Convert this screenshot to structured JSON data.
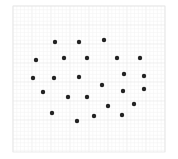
{
  "chart_data": {
    "type": "scatter",
    "title": "",
    "xlabel": "",
    "ylabel": "",
    "grid": true,
    "legend": null,
    "axis_ticks_visible": false,
    "frame": {
      "x0": 13,
      "y0": 6,
      "x1": 165,
      "y1": 152
    },
    "grid_style": {
      "major_step": 19,
      "minor_divisions": 5,
      "major_color": "#e6e6e6",
      "minor_color": "#f3f3f3"
    },
    "marker": {
      "shape": "circle",
      "radius": 2.2,
      "color": "#222222"
    },
    "points": [
      {
        "x": 55,
        "y": 42
      },
      {
        "x": 79,
        "y": 42
      },
      {
        "x": 104,
        "y": 40
      },
      {
        "x": 36,
        "y": 60
      },
      {
        "x": 64,
        "y": 58
      },
      {
        "x": 87,
        "y": 58
      },
      {
        "x": 117,
        "y": 58
      },
      {
        "x": 140,
        "y": 58
      },
      {
        "x": 33,
        "y": 78
      },
      {
        "x": 54,
        "y": 78
      },
      {
        "x": 79,
        "y": 77
      },
      {
        "x": 124,
        "y": 74
      },
      {
        "x": 144,
        "y": 76
      },
      {
        "x": 43,
        "y": 92
      },
      {
        "x": 102,
        "y": 85
      },
      {
        "x": 123,
        "y": 91
      },
      {
        "x": 144,
        "y": 89
      },
      {
        "x": 68,
        "y": 97
      },
      {
        "x": 87,
        "y": 97
      },
      {
        "x": 108,
        "y": 106
      },
      {
        "x": 134,
        "y": 104
      },
      {
        "x": 52,
        "y": 113
      },
      {
        "x": 94,
        "y": 116
      },
      {
        "x": 122,
        "y": 115
      },
      {
        "x": 77,
        "y": 121
      }
    ]
  }
}
